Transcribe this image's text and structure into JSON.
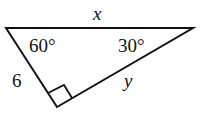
{
  "diagram": {
    "type": "right-triangle",
    "labels": {
      "hypotenuse": "x",
      "short_leg": "6",
      "long_leg": "y",
      "angle_top_left": "60°",
      "angle_top_right": "30°"
    },
    "right_angle_marker": true,
    "stroke_color": "#111111"
  }
}
